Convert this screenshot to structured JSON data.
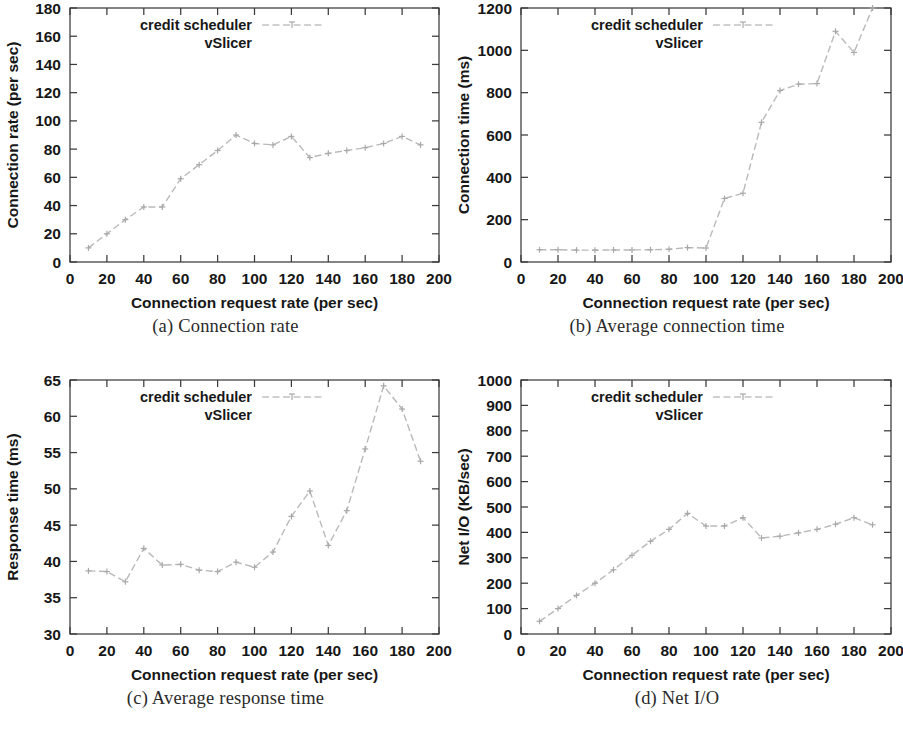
{
  "figure": {
    "panels": [
      {
        "id": "a",
        "caption": "(a) Connection rate",
        "chart_data": {
          "type": "line",
          "title": "",
          "xlabel": "Connection request rate (per sec)",
          "ylabel": "Connection rate (per sec)",
          "xlim": [
            0,
            200
          ],
          "ylim": [
            0,
            180
          ],
          "xticks": [
            0,
            20,
            40,
            60,
            80,
            100,
            120,
            140,
            160,
            180,
            200
          ],
          "yticks": [
            0,
            20,
            40,
            60,
            80,
            100,
            120,
            140,
            160,
            180
          ],
          "grid": false,
          "legend_position": "top-left",
          "series": [
            {
              "name": "credit scheduler",
              "x": [
                10,
                20,
                30,
                40,
                50,
                60,
                70,
                80,
                90,
                100,
                110,
                120,
                130,
                140,
                150,
                160,
                170,
                180,
                190
              ],
              "values": [
                10,
                20,
                30,
                39,
                39,
                59,
                69,
                79,
                90,
                84,
                83,
                89,
                74,
                77,
                79,
                81,
                84,
                89,
                83
              ]
            },
            {
              "name": "vSlicer",
              "x": [],
              "values": []
            }
          ]
        }
      },
      {
        "id": "b",
        "caption": "(b) Average connection time",
        "chart_data": {
          "type": "line",
          "title": "",
          "xlabel": "Connection request rate (per sec)",
          "ylabel": "Connection time (ms)",
          "xlim": [
            0,
            200
          ],
          "ylim": [
            0,
            1200
          ],
          "xticks": [
            0,
            20,
            40,
            60,
            80,
            100,
            120,
            140,
            160,
            180,
            200
          ],
          "yticks": [
            0,
            200,
            400,
            600,
            800,
            1000,
            1200
          ],
          "grid": false,
          "legend_position": "top-left",
          "series": [
            {
              "name": "credit scheduler",
              "x": [
                10,
                20,
                30,
                40,
                50,
                60,
                70,
                80,
                90,
                100,
                110,
                120,
                130,
                140,
                150,
                160,
                170,
                180,
                190
              ],
              "values": [
                58,
                58,
                56,
                56,
                57,
                57,
                58,
                60,
                68,
                66,
                300,
                325,
                660,
                810,
                840,
                843,
                1090,
                990,
                1200
              ]
            },
            {
              "name": "vSlicer",
              "x": [],
              "values": []
            }
          ]
        }
      },
      {
        "id": "c",
        "caption": "(c) Average response time",
        "chart_data": {
          "type": "line",
          "title": "",
          "xlabel": "Connection request rate (per sec)",
          "ylabel": "Response time (ms)",
          "xlim": [
            0,
            200
          ],
          "ylim": [
            30,
            65
          ],
          "xticks": [
            0,
            20,
            40,
            60,
            80,
            100,
            120,
            140,
            160,
            180,
            200
          ],
          "yticks": [
            30,
            35,
            40,
            45,
            50,
            55,
            60,
            65
          ],
          "grid": false,
          "legend_position": "top-left",
          "series": [
            {
              "name": "credit scheduler",
              "x": [
                10,
                20,
                30,
                40,
                50,
                60,
                70,
                80,
                90,
                100,
                110,
                120,
                130,
                140,
                150,
                160,
                170,
                180,
                190
              ],
              "values": [
                38.7,
                38.6,
                37.2,
                41.8,
                39.5,
                39.6,
                38.8,
                38.6,
                39.9,
                39.2,
                41.3,
                46.2,
                49.7,
                42.2,
                47.0,
                55.5,
                64.2,
                61.0,
                53.8
              ]
            },
            {
              "name": "vSlicer",
              "x": [],
              "values": []
            }
          ]
        }
      },
      {
        "id": "d",
        "caption": "(d) Net I/O",
        "chart_data": {
          "type": "line",
          "title": "",
          "xlabel": "Connection request rate (per sec)",
          "ylabel": "Net I/O (KB/sec)",
          "xlim": [
            0,
            200
          ],
          "ylim": [
            0,
            1000
          ],
          "xticks": [
            0,
            20,
            40,
            60,
            80,
            100,
            120,
            140,
            160,
            180,
            200
          ],
          "yticks": [
            0,
            100,
            200,
            300,
            400,
            500,
            600,
            700,
            800,
            900,
            1000
          ],
          "grid": false,
          "legend_position": "top-left",
          "series": [
            {
              "name": "credit scheduler",
              "x": [
                10,
                20,
                30,
                40,
                50,
                60,
                70,
                80,
                90,
                100,
                110,
                120,
                130,
                140,
                150,
                160,
                170,
                180,
                190
              ],
              "values": [
                50,
                100,
                152,
                200,
                253,
                310,
                365,
                412,
                475,
                425,
                425,
                458,
                378,
                385,
                398,
                412,
                432,
                458,
                430
              ]
            },
            {
              "name": "vSlicer",
              "x": [],
              "values": []
            }
          ]
        }
      }
    ],
    "colors": {
      "line": "#b9b9b9",
      "axis": "#3b3b3b",
      "text": "#171717"
    }
  }
}
